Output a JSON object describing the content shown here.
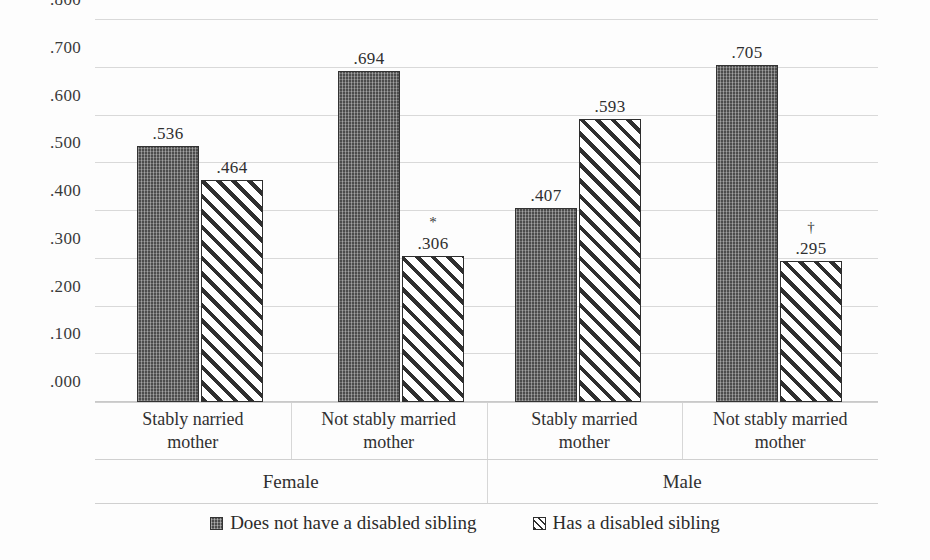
{
  "chart_data": {
    "type": "bar",
    "title": "",
    "xlabel": "",
    "ylabel": "",
    "ylim": [
      0.0,
      0.8
    ],
    "ytick_labels": [
      ".800",
      ".700",
      ".600",
      ".500",
      ".400",
      ".300",
      ".200",
      ".100",
      ".000"
    ],
    "ytick_values": [
      0.8,
      0.7,
      0.6,
      0.5,
      0.4,
      0.3,
      0.2,
      0.1,
      0.0
    ],
    "grid": true,
    "legend_position": "bottom",
    "panels": [
      "Female",
      "Male"
    ],
    "categories": [
      "Stably narried mother",
      "Not stably married mother",
      "Stably married mother",
      "Not stably married mother"
    ],
    "series": [
      {
        "name": "Does not have a disabled sibling",
        "pattern": "solid-dotted",
        "values": [
          0.536,
          0.694,
          0.407,
          0.705
        ],
        "labels": [
          ".536",
          ".694",
          ".407",
          ".705"
        ]
      },
      {
        "name": "Has a disabled sibling",
        "pattern": "diagonal-hatch",
        "values": [
          0.464,
          0.306,
          0.593,
          0.295
        ],
        "labels": [
          ".464",
          ".306",
          ".593",
          ".295"
        ]
      }
    ],
    "annotations": [
      {
        "group": 1,
        "series": 1,
        "symbol": "*"
      },
      {
        "group": 3,
        "series": 1,
        "symbol": "†"
      }
    ]
  },
  "axis": {
    "ticks": [
      {
        "label": ".800",
        "value": 0.8
      },
      {
        "label": ".700",
        "value": 0.7
      },
      {
        "label": ".600",
        "value": 0.6
      },
      {
        "label": ".500",
        "value": 0.5
      },
      {
        "label": ".400",
        "value": 0.4
      },
      {
        "label": ".300",
        "value": 0.3
      },
      {
        "label": ".200",
        "value": 0.2
      },
      {
        "label": ".100",
        "value": 0.1
      },
      {
        "label": ".000",
        "value": 0.0
      }
    ]
  },
  "groups": [
    {
      "category_line1": "Stably narried",
      "category_line2": "mother",
      "panel": "Female",
      "bars": [
        {
          "label": ".536",
          "value": 0.536,
          "style": "solid",
          "marker": ""
        },
        {
          "label": ".464",
          "value": 0.464,
          "style": "hatch",
          "marker": ""
        }
      ]
    },
    {
      "category_line1": "Not stably married",
      "category_line2": "mother",
      "panel": "Female",
      "bars": [
        {
          "label": ".694",
          "value": 0.694,
          "style": "solid",
          "marker": ""
        },
        {
          "label": ".306",
          "value": 0.306,
          "style": "hatch",
          "marker": "*"
        }
      ]
    },
    {
      "category_line1": "Stably married",
      "category_line2": "mother",
      "panel": "Male",
      "bars": [
        {
          "label": ".407",
          "value": 0.407,
          "style": "solid",
          "marker": ""
        },
        {
          "label": ".593",
          "value": 0.593,
          "style": "hatch",
          "marker": ""
        }
      ]
    },
    {
      "category_line1": "Not stably married",
      "category_line2": "mother",
      "panel": "Male",
      "bars": [
        {
          "label": ".705",
          "value": 0.705,
          "style": "solid",
          "marker": ""
        },
        {
          "label": ".295",
          "value": 0.295,
          "style": "hatch",
          "marker": "†"
        }
      ]
    }
  ],
  "panels": [
    {
      "label": "Female"
    },
    {
      "label": "Male"
    }
  ],
  "legend": {
    "items": [
      {
        "label": "Does not have a disabled sibling",
        "style": "solid",
        "icon": "legend-swatch-dotted-icon"
      },
      {
        "label": "Has a disabled sibling",
        "style": "hatch",
        "icon": "legend-swatch-hatched-icon"
      }
    ]
  }
}
